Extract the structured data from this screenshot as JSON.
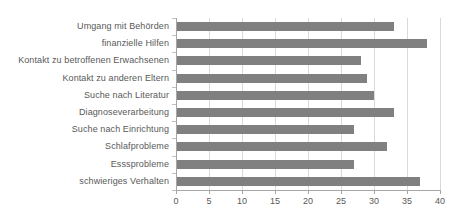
{
  "chart_data": {
    "type": "bar",
    "orientation": "horizontal",
    "title": "",
    "subtitle": "",
    "xlabel": "",
    "ylabel": "",
    "xlim": [
      0,
      40
    ],
    "xticks": [
      0,
      5,
      10,
      15,
      20,
      25,
      30,
      35,
      40
    ],
    "grid": "vertical",
    "legend": "none",
    "bar_color": "#808080",
    "gridline_color": "#d9d9d9",
    "axis_color": "#a6a6a6",
    "text_color": "#595959",
    "categories": [
      "Umgang mit Behörden",
      "finanzielle Hilfen",
      "Kontakt zu betroffenen Erwachsenen",
      "Kontakt zu anderen Eltern",
      "Suche nach Literatur",
      "Diagnoseverarbeitung",
      "Suche nach Einrichtung",
      "Schlafprobleme",
      "Esssprobleme",
      "schwieriges Verhalten"
    ],
    "values": [
      33,
      38,
      28,
      29,
      30,
      33,
      27,
      32,
      27,
      37
    ]
  }
}
